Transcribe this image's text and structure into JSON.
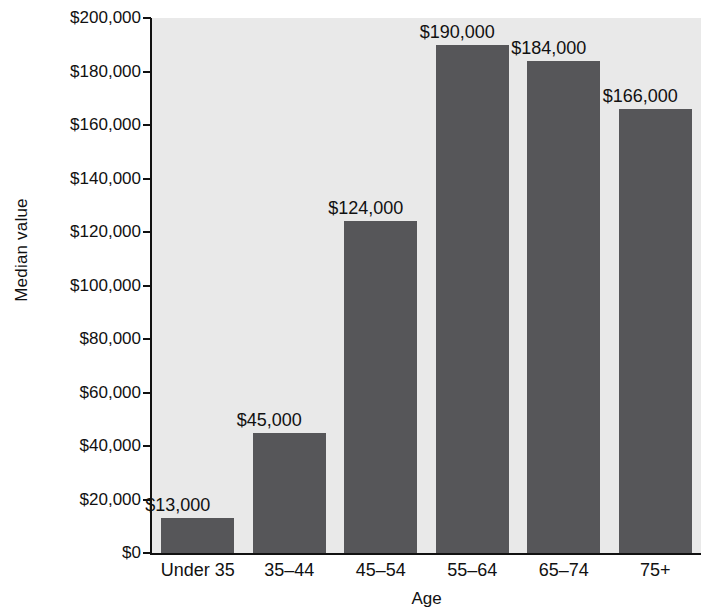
{
  "chart_data": {
    "type": "bar",
    "title": "",
    "subtitle": "",
    "xlabel": "Age",
    "ylabel": "Median value",
    "categories": [
      "Under 35",
      "35–44",
      "45–54",
      "55–64",
      "65–74",
      "75+"
    ],
    "values": [
      13000,
      45000,
      124000,
      190000,
      184000,
      166000
    ],
    "value_labels": [
      "$13,000",
      "$45,000",
      "$124,000",
      "$190,000",
      "$184,000",
      "$166,000"
    ],
    "ylim": [
      0,
      200000
    ],
    "ytick_values": [
      0,
      20000,
      40000,
      60000,
      80000,
      100000,
      120000,
      140000,
      160000,
      180000,
      200000
    ],
    "ytick_labels": [
      "$0",
      "$20,000",
      "$40,000",
      "$60,000",
      "$80,000",
      "$100,000",
      "$120,000",
      "$140,000",
      "$160,000",
      "$180,000",
      "$200,000"
    ],
    "grid": false,
    "legend": false,
    "legend_position": "none",
    "bar_color": "#565659",
    "plot_background": "#e9e9e9",
    "axis_color": "#111111",
    "figure_background": "#ffffff"
  }
}
